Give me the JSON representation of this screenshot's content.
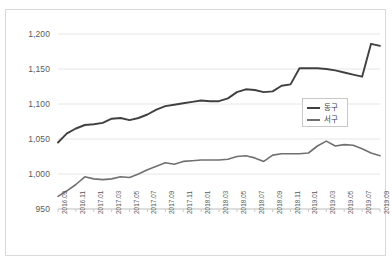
{
  "chart_data": {
    "type": "line",
    "title": "",
    "xlabel": "",
    "ylabel": "",
    "ylim": [
      950,
      1200
    ],
    "yticks": [
      "950",
      "1,000",
      "1,050",
      "1,100",
      "1,150",
      "1,200"
    ],
    "ytick_values": [
      950,
      1000,
      1050,
      1100,
      1150,
      1200
    ],
    "grid": true,
    "legend_position": "center-right",
    "x": [
      "2016.09",
      "2016.10",
      "2016.11",
      "2016.12",
      "2017.01",
      "2017.02",
      "2017.03",
      "2017.04",
      "2017.05",
      "2017.06",
      "2017.07",
      "2017.08",
      "2017.09",
      "2017.10",
      "2017.11",
      "2017.12",
      "2018.01",
      "2018.02",
      "2018.03",
      "2018.04",
      "2018.05",
      "2018.06",
      "2018.07",
      "2018.08",
      "2018.09",
      "2018.10",
      "2018.11",
      "2018.12",
      "2019.01",
      "2019.02",
      "2019.03",
      "2019.04",
      "2019.05",
      "2019.06",
      "2019.07",
      "2019.08",
      "2019.09"
    ],
    "xtick_labels": [
      "2016.09",
      "2016.11",
      "2017.01",
      "2017.03",
      "2017.05",
      "2017.07",
      "2017.09",
      "2017.11",
      "2018.01",
      "2018.03",
      "2018.05",
      "2018.07",
      "2018.09",
      "2018.11",
      "2019.01",
      "2019.03",
      "2019.05",
      "2019.07",
      "2019.09"
    ],
    "series": [
      {
        "name": "동구",
        "color": "#404040",
        "values": [
          1045,
          1058,
          1065,
          1070,
          1071,
          1073,
          1079,
          1080,
          1077,
          1080,
          1085,
          1092,
          1097,
          1099,
          1101,
          1103,
          1105,
          1104,
          1104,
          1108,
          1117,
          1121,
          1120,
          1117,
          1118,
          1126,
          1128,
          1151,
          1151,
          1151,
          1150,
          1148,
          1145,
          1142,
          1139,
          1186,
          1183
        ]
      },
      {
        "name": "서구",
        "color": "#707070",
        "values": [
          968,
          976,
          985,
          996,
          993,
          992,
          993,
          996,
          995,
          1000,
          1006,
          1011,
          1016,
          1014,
          1018,
          1019,
          1020,
          1020,
          1020,
          1021,
          1025,
          1026,
          1023,
          1018,
          1027,
          1029,
          1029,
          1029,
          1030,
          1040,
          1047,
          1040,
          1042,
          1041,
          1036,
          1030,
          1026
        ]
      }
    ]
  }
}
